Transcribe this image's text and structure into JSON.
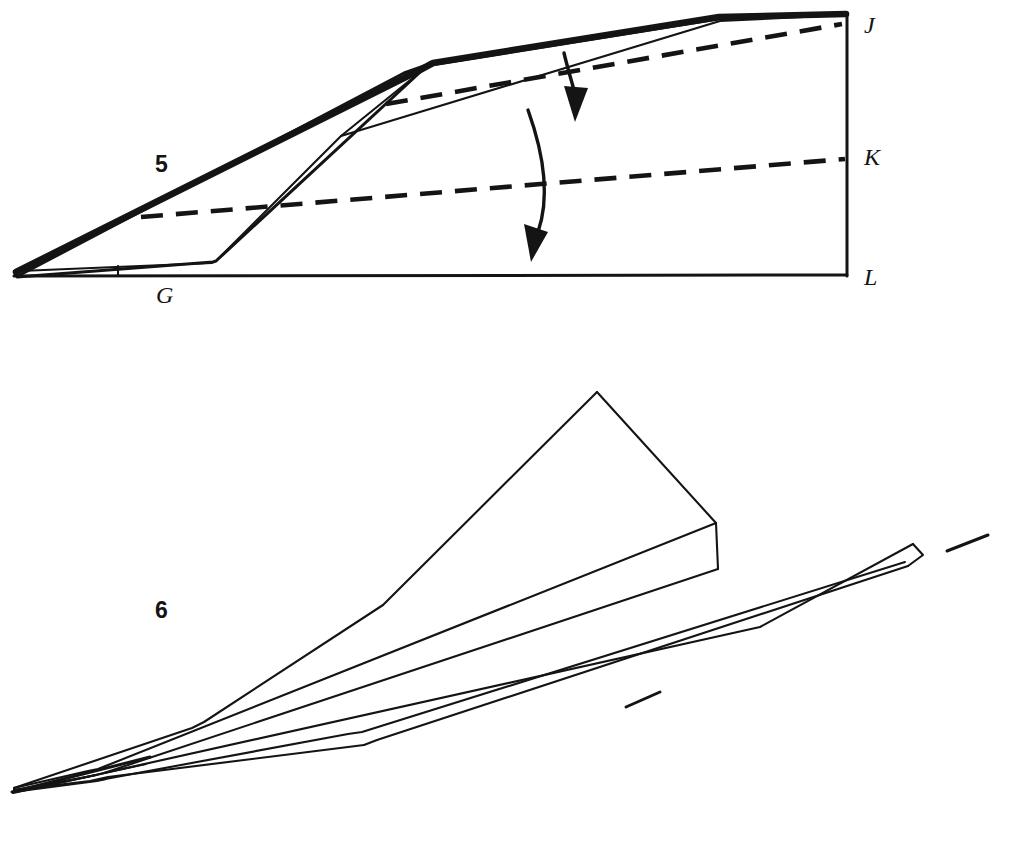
{
  "document": {
    "kind": "origami-instruction-diagram",
    "subject": "paper airplane folding steps",
    "background_color": "#ffffff",
    "ink_color": "#141414"
  },
  "figures": [
    {
      "id": "figure-5",
      "step_number": "5",
      "caption_labels": [
        {
          "name": "G",
          "text": "G",
          "x": 163,
          "y": 298
        }
      ],
      "edge_labels": [
        {
          "name": "J",
          "text": "J",
          "x": 864,
          "y": 33
        },
        {
          "name": "K",
          "text": "K",
          "x": 864,
          "y": 163
        },
        {
          "name": "L",
          "text": "L",
          "x": 864,
          "y": 283
        }
      ],
      "fold_arrows": [
        {
          "name": "upper-fold-arrow",
          "direction": "down"
        },
        {
          "name": "lower-fold-arrow",
          "direction": "down"
        }
      ],
      "fold_lines_dashed": 2,
      "description": "Side view of a folded paper wedge with two dashed valley-fold lines and two downward curved arrows; right edge marked J at top, K at middle, L at bottom; bottom left corner region marked G."
    },
    {
      "id": "figure-6",
      "step_number": "6",
      "motion_marks": [
        {
          "name": "upper-motion-dash"
        },
        {
          "name": "lower-motion-dash"
        }
      ],
      "description": "Completed paper airplane in three-quarter perspective, nose pointing to lower left, two swept wings with a raised body ridge; two short diagonal motion dashes near the wing tips."
    }
  ]
}
